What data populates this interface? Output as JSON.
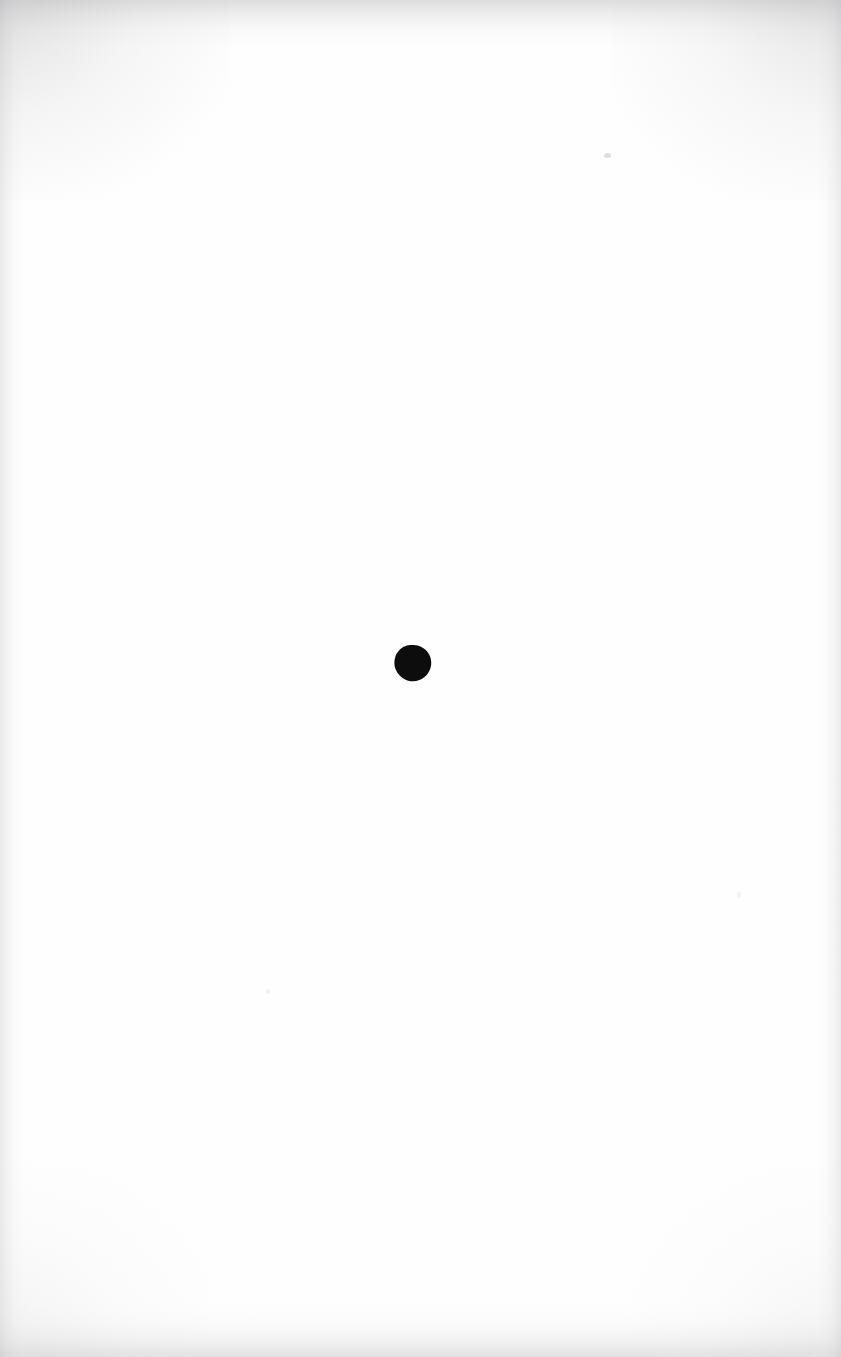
{
  "document": {
    "kind": "scanned-page",
    "page_label": "",
    "visible_text": "",
    "body_text": "",
    "note": "blank scanned page"
  },
  "canvas": {
    "width": 841,
    "height": 1357,
    "background_color": "#ffffff",
    "paper_color": "#ffffff"
  },
  "marks": [
    {
      "id": "ink-dot",
      "name": "ink-dot",
      "shape": "circle",
      "color": "#101010",
      "center_x": 413,
      "center_y": 664,
      "diameter": 39,
      "label": ""
    },
    {
      "id": "speck-upper-right",
      "name": "faint-speck",
      "shape": "speck",
      "color": "#96969b",
      "center_x": 607,
      "center_y": 156,
      "diameter": 6,
      "label": ""
    },
    {
      "id": "speck-lower-left",
      "name": "faint-speck",
      "shape": "speck",
      "color": "#babac0",
      "center_x": 268,
      "center_y": 992,
      "diameter": 4,
      "label": ""
    },
    {
      "id": "speck-mid-right",
      "name": "faint-speck",
      "shape": "speck",
      "color": "#bebec2",
      "center_x": 739,
      "center_y": 895,
      "diameter": 5,
      "label": ""
    }
  ],
  "scan_artifacts": {
    "vignette_top_color": "#b0b0b2",
    "vignette_bottom_color": "#babac0",
    "vignette_left_color": "#c4c4c6",
    "vignette_right_color": "#c6c6c8",
    "corner_shadow_color": "#aaaaad"
  }
}
